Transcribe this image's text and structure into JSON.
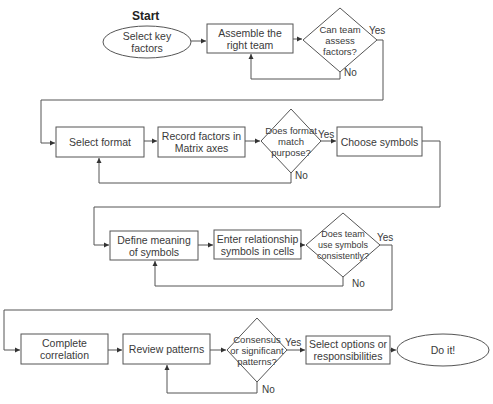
{
  "start_label": "Start",
  "rows": [
    {
      "start_oval": "Select key factors",
      "step1": "Assemble the right team",
      "decision": "Can team assess factors?",
      "yes": "Yes",
      "no": "No"
    },
    {
      "step1": "Select format",
      "step2": "Record factors in Matrix axes",
      "decision": "Does format match purpose?",
      "yes": "Yes",
      "no": "No",
      "step3": "Choose symbols"
    },
    {
      "step1": "Define meaning of symbols",
      "step2": "Enter relationship symbols in cells",
      "decision": "Does team use symbols consistently?",
      "yes": "Yes",
      "no": "No"
    },
    {
      "step1": "Complete correlation",
      "step2": "Review patterns",
      "decision": "Consensus or significant patterns?",
      "yes": "Yes",
      "no": "No",
      "step3": "Select options or responsibilities",
      "end_oval": "Do it!"
    }
  ],
  "colors": {
    "stroke": "#555555",
    "text": "#3a3a3a",
    "background": "#ffffff"
  }
}
